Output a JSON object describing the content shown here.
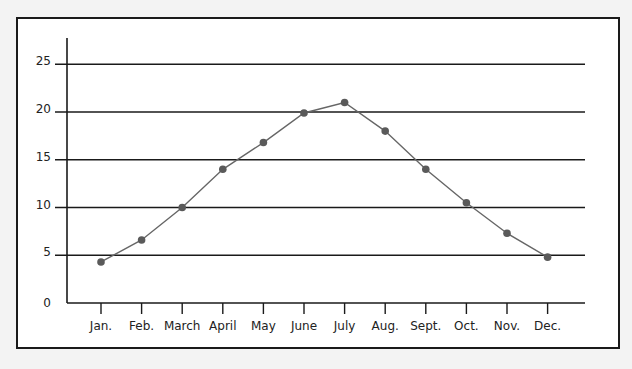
{
  "chart_data": {
    "type": "line",
    "title": "",
    "xlabel": "",
    "ylabel": "",
    "categories": [
      "Jan.",
      "Feb.",
      "March",
      "April",
      "May",
      "June",
      "July",
      "Aug.",
      "Sept.",
      "Oct.",
      "Nov.",
      "Dec."
    ],
    "series": [
      {
        "name": "series-1",
        "values": [
          4.3,
          6.6,
          10,
          14,
          16.8,
          19.9,
          21,
          18,
          14,
          10.5,
          7.3,
          4.8
        ],
        "color": "#666666",
        "marker_color": "#5a5a5a"
      }
    ],
    "ylim": [
      0,
      25
    ],
    "yticks": [
      0,
      5,
      10,
      15,
      20,
      25
    ],
    "grid": true,
    "legend": "none"
  },
  "colors": {
    "background": "#f3f3f3",
    "plot_background": "#ffffff",
    "axis": "#1a1a1a",
    "gridline": "#1a1a1a",
    "line": "#666666",
    "marker": "#5a5a5a"
  }
}
